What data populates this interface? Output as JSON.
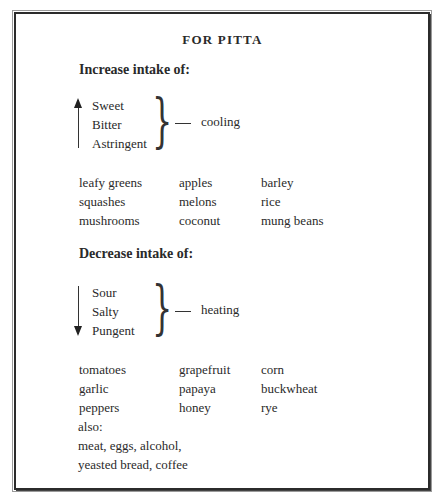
{
  "title": "FOR PITTA",
  "increase": {
    "heading": "Increase intake of:",
    "tastes": [
      "Sweet",
      "Bitter",
      "Astringent"
    ],
    "arrow": "up",
    "effect": "cooling",
    "foods": [
      [
        "leafy greens",
        "apples",
        "barley"
      ],
      [
        "squashes",
        "melons",
        "rice"
      ],
      [
        "mushrooms",
        "coconut",
        "mung beans"
      ]
    ]
  },
  "decrease": {
    "heading": "Decrease intake of:",
    "tastes": [
      "Sour",
      "Salty",
      "Pungent"
    ],
    "arrow": "down",
    "effect": "heating",
    "foods": [
      [
        "tomatoes",
        "grapefruit",
        "corn"
      ],
      [
        "garlic",
        "papaya",
        "buckwheat"
      ],
      [
        "peppers",
        "honey",
        "rye"
      ]
    ],
    "also_label": "also:",
    "also_lines": [
      "meat, eggs, alcohol,",
      "yeasted bread, coffee"
    ]
  },
  "icons": {
    "brace": "}"
  }
}
